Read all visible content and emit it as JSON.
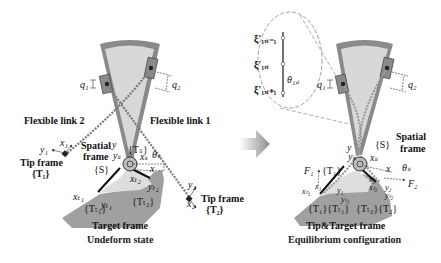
{
  "colors": {
    "frame_outer": "#8a8a8a",
    "frame_inner": "#d9d9d9",
    "target_body": "#9e9e9e",
    "target_inner": "#dcdcdc",
    "chain": "#7a7a7a",
    "arrow": "#9a9a9a",
    "text": "#111111"
  },
  "left_panel": {
    "caption": "Undeform state",
    "labels": {
      "flex_link_2": "Flexible link 2",
      "flex_link_1": "Flexible link 1",
      "q1": "q₁",
      "q2": "q₂",
      "tip_frame_1_title": "Tip frame",
      "tip_frame_1_sym": "{T₁}",
      "tip_frame_2_title": "Tip frame",
      "tip_frame_2_sym": "{T₂}",
      "spatial_frame_line1": "Spatial",
      "spatial_frame_line2": "frame",
      "spatial_sym": "{S}",
      "target_frame": "Target frame",
      "tt1": "{Tₜ₁}",
      "tt2": "{Tₜ₂}",
      "ts": "{Tₛ}",
      "theta": "θₛ",
      "x1": "x₁",
      "y1": "y₁",
      "x2": "x₂",
      "y2": "y₂",
      "xt1": "xₜ₁",
      "yt1": "yₜ₁",
      "xt2": "xₜ₂",
      "yt2": "yₜ₂",
      "y": "y",
      "ys": "yₛ",
      "xs": "xₛ",
      "x": "x"
    }
  },
  "right_panel": {
    "caption": "Equilibrium configuration",
    "labels": {
      "xi_prev": "ξ′₁,ᵢ₋₁",
      "xi_i": "ξ′₁,ᵢ",
      "xi_next": "ξ′₁,ᵢ₊₁",
      "theta_1i": "θ₁,ᵢ",
      "q1": "q₁",
      "q2": "q₂",
      "spatial_frame_line1": "Spatial",
      "spatial_frame_line2": "frame",
      "spatial_sym": "{S}",
      "F1": "F₁",
      "F2": "F₂",
      "T1": "{T₁}",
      "theta_s": "θₛ",
      "tip_target_frame": "Tip&Target frame",
      "combo_left": "{T₁}{Tₜ₁}",
      "combo_right": "{Tₜ₂}{T₂}",
      "x1": "x₁",
      "xt1": "xₜ₁",
      "y1": "y₁",
      "yt1": "yₜ₁",
      "x2": "x₂",
      "xt2": "xₜ₂",
      "y2": "y₂",
      "yt2": "yₜ₂",
      "xs": "xₛ",
      "y": "y",
      "ys": "yₛ",
      "x": "x"
    }
  }
}
